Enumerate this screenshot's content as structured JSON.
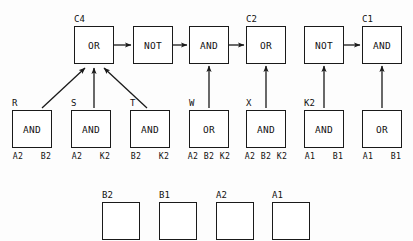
{
  "diagram": {
    "stroke_color": "#1a1a1a",
    "background_color": "#fdfdfd",
    "rows": {
      "top": [
        {
          "id": "c4-or",
          "label": "OR",
          "group_label": "C4",
          "x": 74,
          "y": 26,
          "w": 40,
          "h": 38
        },
        {
          "id": "not-1",
          "label": "NOT",
          "group_label": "",
          "x": 133,
          "y": 26,
          "w": 40,
          "h": 38
        },
        {
          "id": "and-1",
          "label": "AND",
          "group_label": "",
          "x": 189,
          "y": 26,
          "w": 40,
          "h": 38
        },
        {
          "id": "c2-or",
          "label": "OR",
          "group_label": "C2",
          "x": 246,
          "y": 26,
          "w": 40,
          "h": 38
        },
        {
          "id": "not-2",
          "label": "NOT",
          "group_label": "",
          "x": 304,
          "y": 26,
          "w": 40,
          "h": 38
        },
        {
          "id": "c1-and",
          "label": "AND",
          "group_label": "C1",
          "x": 362,
          "y": 26,
          "w": 40,
          "h": 38
        }
      ],
      "middle": [
        {
          "id": "gate-r",
          "label": "AND",
          "group_label": "R",
          "x": 12,
          "y": 110,
          "w": 40,
          "h": 38,
          "pins": [
            "A2",
            "B2"
          ]
        },
        {
          "id": "gate-s",
          "label": "AND",
          "group_label": "S",
          "x": 71,
          "y": 110,
          "w": 40,
          "h": 38,
          "pins": [
            "A2",
            "K2"
          ]
        },
        {
          "id": "gate-t",
          "label": "AND",
          "group_label": "T",
          "x": 130,
          "y": 110,
          "w": 40,
          "h": 38,
          "pins": [
            "B2",
            "K2"
          ]
        },
        {
          "id": "gate-w",
          "label": "OR",
          "group_label": "W",
          "x": 189,
          "y": 110,
          "w": 40,
          "h": 38,
          "pins": [
            "A2",
            "B2",
            "K2"
          ]
        },
        {
          "id": "gate-x",
          "label": "AND",
          "group_label": "X",
          "x": 246,
          "y": 110,
          "w": 40,
          "h": 38,
          "pins": [
            "A2",
            "B2",
            "K2"
          ]
        },
        {
          "id": "gate-k2",
          "label": "AND",
          "group_label": "K2",
          "x": 304,
          "y": 110,
          "w": 40,
          "h": 38,
          "pins": [
            "A1",
            "B1"
          ]
        },
        {
          "id": "gate-or2",
          "label": "OR",
          "group_label": "",
          "x": 362,
          "y": 110,
          "w": 40,
          "h": 38,
          "pins": [
            "A1",
            "B1"
          ]
        }
      ],
      "bottom": [
        {
          "id": "input-b2",
          "group_label": "B2",
          "x": 102,
          "y": 202,
          "w": 38,
          "h": 38
        },
        {
          "id": "input-b1",
          "group_label": "B1",
          "x": 159,
          "y": 202,
          "w": 38,
          "h": 38
        },
        {
          "id": "input-a2",
          "group_label": "A2",
          "x": 216,
          "y": 202,
          "w": 38,
          "h": 38
        },
        {
          "id": "input-a1",
          "group_label": "A1",
          "x": 272,
          "y": 202,
          "w": 38,
          "h": 38
        }
      ]
    },
    "connections": [
      {
        "from": "gate-r",
        "to": "c4-or",
        "kind": "diagonal-up-right"
      },
      {
        "from": "gate-s",
        "to": "c4-or",
        "kind": "vertical-up"
      },
      {
        "from": "gate-t",
        "to": "c4-or",
        "kind": "diagonal-up-left"
      },
      {
        "from": "c4-or",
        "to": "not-1",
        "kind": "horizontal-right"
      },
      {
        "from": "not-1",
        "to": "and-1",
        "kind": "horizontal-right"
      },
      {
        "from": "gate-w",
        "to": "and-1",
        "kind": "vertical-up"
      },
      {
        "from": "and-1",
        "to": "c2-or",
        "kind": "horizontal-right"
      },
      {
        "from": "gate-x",
        "to": "c2-or",
        "kind": "vertical-up"
      },
      {
        "from": "gate-k2",
        "to": "not-2",
        "kind": "vertical-up"
      },
      {
        "from": "not-2",
        "to": "c1-and",
        "kind": "horizontal-right"
      },
      {
        "from": "gate-or2",
        "to": "c1-and",
        "kind": "vertical-up"
      }
    ]
  }
}
